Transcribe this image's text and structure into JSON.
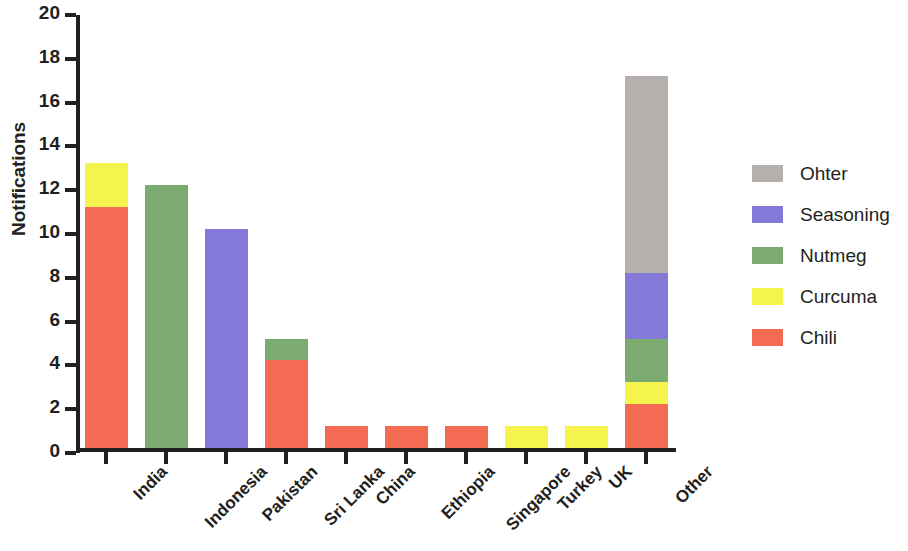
{
  "chart_data": {
    "type": "bar",
    "subtype": "stacked-bar",
    "title": "",
    "subtitle": "",
    "xlabel": "",
    "ylabel": "Notifications",
    "ylim": [
      0,
      20
    ],
    "ytick_step": 2,
    "ytick_labels": [
      "0",
      "2",
      "4",
      "6",
      "8",
      "10",
      "12",
      "14",
      "16",
      "18",
      "20"
    ],
    "grid": false,
    "legend_position": "right",
    "categories": [
      "India",
      "Indonesia",
      "Pakistan",
      "Sri Lanka",
      "China",
      "Ethiopia",
      "Singapore",
      "Turkey",
      "UK",
      "Other"
    ],
    "series": [
      {
        "name": "Chili",
        "color": "#F26B52",
        "values": [
          11,
          0,
          0,
          4,
          1,
          1,
          1,
          0,
          0,
          2
        ]
      },
      {
        "name": "Curcuma",
        "color": "#F5F34E",
        "values": [
          2,
          0,
          0,
          0,
          0,
          0,
          0,
          1,
          1,
          1
        ]
      },
      {
        "name": "Nutmeg",
        "color": "#7BAB6E",
        "values": [
          0,
          12,
          0,
          1,
          0,
          0,
          0,
          0,
          0,
          2
        ]
      },
      {
        "name": "Seasoning",
        "color": "#8478D8",
        "values": [
          0,
          0,
          10,
          0,
          0,
          0,
          0,
          0,
          0,
          3
        ]
      },
      {
        "name": "Ohter",
        "color": "#B5AFAD",
        "values": [
          0,
          0,
          0,
          0,
          0,
          0,
          0,
          0,
          0,
          9
        ]
      }
    ],
    "totals": [
      13,
      12,
      10,
      5,
      1,
      1,
      1,
      1,
      1,
      17
    ],
    "legend_entries": [
      {
        "label": "Ohter",
        "color": "#B5AFAD"
      },
      {
        "label": "Seasoning",
        "color": "#8478D8"
      },
      {
        "label": "Nutmeg",
        "color": "#7BAB6E"
      },
      {
        "label": "Curcuma",
        "color": "#F5F34E"
      },
      {
        "label": "Chili",
        "color": "#F26B52"
      }
    ],
    "axis_color": "#231f20"
  }
}
